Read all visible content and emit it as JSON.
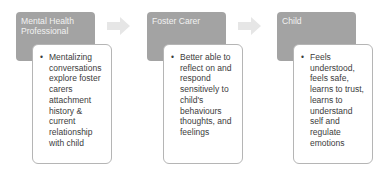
{
  "diagram": {
    "type": "process-flow",
    "stages": [
      {
        "title": "Mental Health Professional",
        "bullets": [
          "Mentalizing conversations explore foster carers attachment history & current relationship with child"
        ]
      },
      {
        "title": "Foster Carer",
        "bullets": [
          "Better able to reflect on and respond sensitively to child's behaviours thoughts, and feelings"
        ]
      },
      {
        "title": "Child",
        "bullets": [
          "Feels understood, feels safe, learns to trust, learns to understand self and regulate emotions"
        ]
      }
    ],
    "connectors": [
      {
        "from": "Mental Health Professional",
        "to": "Foster Carer",
        "icon": "arrow-right-icon"
      },
      {
        "from": "Foster Carer",
        "to": "Child",
        "icon": "arrow-right-icon"
      }
    ],
    "colors": {
      "header_fill": "#a3a3a3",
      "header_text": "#f2f2f2",
      "body_fill": "#ffffff",
      "body_border": "#b5b5b5",
      "body_text": "#3c3c3c",
      "arrow_fill": "#e6e6e6"
    }
  }
}
